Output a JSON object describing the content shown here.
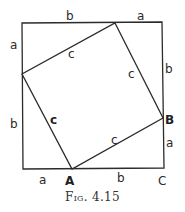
{
  "figure": {
    "caption": "Fig. 4.15",
    "outer_square": {
      "top_labels": [
        "b",
        "a"
      ],
      "right_labels": [
        "b",
        "a"
      ],
      "bottom_labels": [
        "a",
        "b"
      ],
      "left_labels": [
        "a",
        "b"
      ]
    },
    "inner_square": {
      "side_labels": [
        "c",
        "c",
        "c",
        "c"
      ]
    },
    "points": {
      "A": "A",
      "B": "B",
      "C": "C"
    },
    "colors": {
      "line": "#2b2b2b",
      "background": "#ffffff"
    }
  }
}
